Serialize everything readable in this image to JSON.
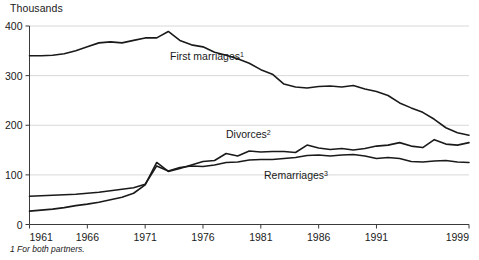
{
  "chart_data": {
    "type": "line",
    "title": "",
    "ylabel": "Thousands",
    "xlabel": "",
    "ylim": [
      0,
      400
    ],
    "xlim": [
      1961,
      1999
    ],
    "grid": true,
    "legend_position": "inline-annotations",
    "y_ticks": [
      0,
      100,
      200,
      300,
      400
    ],
    "y_tick_labels": [
      "0",
      "100",
      "200",
      "300",
      "400"
    ],
    "x_ticks": [
      1961,
      1966,
      1971,
      1976,
      1981,
      1986,
      1991,
      1999
    ],
    "x_tick_labels": [
      "1961",
      "1966",
      "1971",
      "1976",
      "1981",
      "1986",
      "1991",
      "1999"
    ],
    "x": [
      1961,
      1962,
      1963,
      1964,
      1965,
      1966,
      1967,
      1968,
      1969,
      1970,
      1971,
      1972,
      1973,
      1974,
      1975,
      1976,
      1977,
      1978,
      1979,
      1980,
      1981,
      1982,
      1983,
      1984,
      1985,
      1986,
      1987,
      1988,
      1989,
      1990,
      1991,
      1992,
      1993,
      1994,
      1995,
      1996,
      1997,
      1998,
      1999
    ],
    "series": [
      {
        "name": "First marriages",
        "footnote_marker": "1",
        "label": "First marriages",
        "color": "#1a1a1a",
        "values": [
          340,
          340,
          341,
          344,
          350,
          358,
          366,
          368,
          366,
          371,
          376,
          376,
          389,
          371,
          362,
          358,
          347,
          341,
          334,
          325,
          312,
          303,
          283,
          277,
          275,
          278,
          279,
          277,
          280,
          273,
          268,
          260,
          245,
          235,
          226,
          212,
          195,
          185,
          180
        ]
      },
      {
        "name": "Divorces",
        "footnote_marker": "2",
        "label": "Divorces",
        "color": "#1a1a1a",
        "values": [
          27,
          29,
          31,
          34,
          38,
          41,
          45,
          50,
          55,
          63,
          80,
          125,
          107,
          113,
          120,
          127,
          129,
          143,
          138,
          148,
          146,
          147,
          147,
          145,
          160,
          154,
          151,
          153,
          150,
          153,
          158,
          160,
          165,
          158,
          155,
          171,
          162,
          160,
          165
        ]
      },
      {
        "name": "Remarriages",
        "footnote_marker": "3",
        "label": "Remarriages",
        "color": "#1a1a1a",
        "values": [
          57,
          58,
          59,
          60,
          61,
          63,
          65,
          68,
          71,
          74,
          81,
          118,
          108,
          115,
          118,
          117,
          120,
          125,
          126,
          130,
          131,
          131,
          133,
          135,
          139,
          140,
          138,
          140,
          141,
          138,
          133,
          135,
          133,
          127,
          126,
          128,
          129,
          126,
          125
        ]
      }
    ],
    "annotations": [
      {
        "text": "First marriages",
        "sup": "1",
        "x_px": 170,
        "y_px": 60
      },
      {
        "text": "Divorces",
        "sup": "2",
        "x_px": 226,
        "y_px": 138
      },
      {
        "text": "Remarriages",
        "sup": "3",
        "x_px": 264,
        "y_px": 179
      }
    ],
    "footnote": "1 For both partners."
  }
}
